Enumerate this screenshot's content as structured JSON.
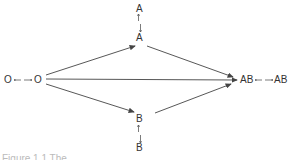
{
  "diagram": {
    "nodes": {
      "A_top": "A",
      "A_mid": "A",
      "O_left": "O",
      "O_right": "O",
      "AB_left": "AB",
      "AB_right": "AB",
      "B_mid": "B",
      "B_bottom": "B"
    },
    "bidirectional_arrow": "←→",
    "vertical_arrow": "↑↓",
    "edges": [
      {
        "from": "O",
        "to": "A"
      },
      {
        "from": "A",
        "to": "AB"
      },
      {
        "from": "O",
        "to": "AB"
      },
      {
        "from": "O",
        "to": "B"
      },
      {
        "from": "B",
        "to": "AB"
      }
    ],
    "caption": "Figure 1.1  The ..."
  },
  "colors": {
    "line": "#444444",
    "text": "#333333"
  }
}
